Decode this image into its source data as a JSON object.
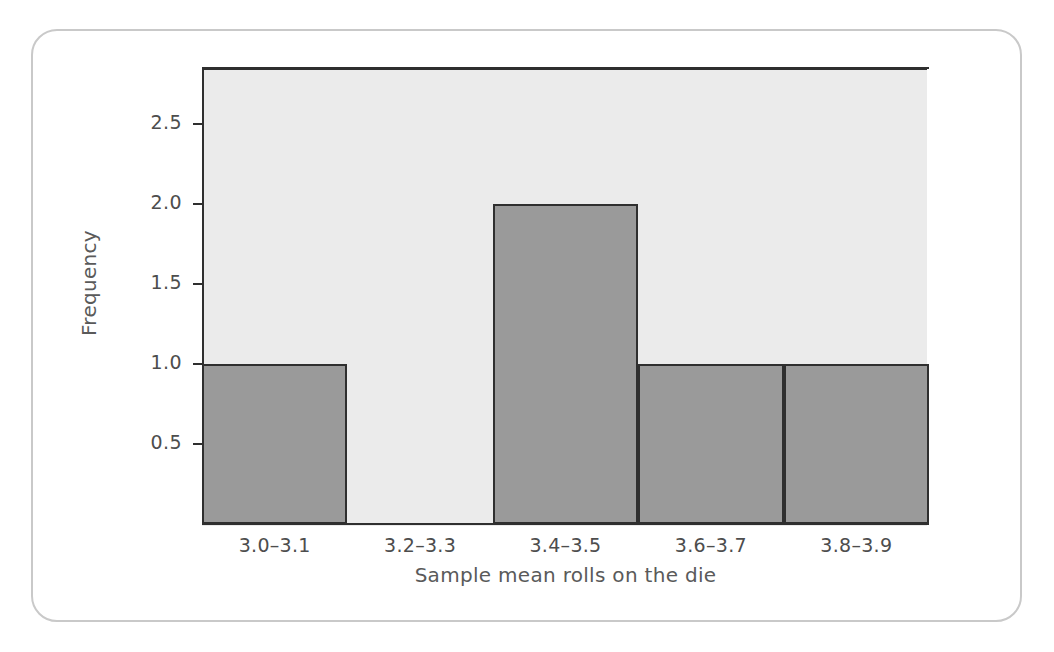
{
  "figure": {
    "background_color": "#ffffff",
    "card_border_color": "#c9c9c9",
    "plot_background_color": "#ebebeb",
    "bar_fill_color": "#9a9a9a",
    "bar_edge_color": "#2f2f2f",
    "axis_color": "#2f2f2f",
    "text_color": "#4d4d4d"
  },
  "chart_data": {
    "type": "bar",
    "title": "",
    "xlabel": "Sample mean rolls on the die",
    "ylabel": "Frequency",
    "categories": [
      "3.0–3.1",
      "3.2–3.3",
      "3.4–3.5",
      "3.6–3.7",
      "3.8–3.9"
    ],
    "values": [
      1,
      0,
      2,
      1,
      1
    ],
    "ylim": [
      0,
      2.85
    ],
    "yticks": [
      0.5,
      1.0,
      1.5,
      2.0,
      2.5
    ],
    "ytick_labels": [
      "0.5",
      "1.0",
      "1.5",
      "2.0",
      "2.5"
    ],
    "grid": false,
    "legend": false,
    "legend_position": "none",
    "bar_gap": 0
  }
}
